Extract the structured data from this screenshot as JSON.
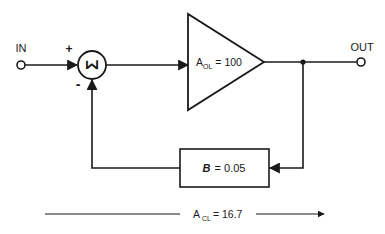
{
  "diagram": {
    "input_label": "IN",
    "output_label": "OUT",
    "summing_junction": {
      "symbol": "Σ",
      "plus_sign": "+",
      "minus_sign": "-"
    },
    "amplifier": {
      "gain_symbol": "A",
      "gain_subscript": "OL",
      "gain_value": "= 100"
    },
    "feedback_block": {
      "symbol": "B",
      "value": "= 0.05"
    },
    "closed_loop": {
      "gain_symbol": "A",
      "gain_subscript": "CL",
      "gain_value": "= 16.7"
    },
    "colors": {
      "stroke": "#1a1a1a",
      "background": "#ffffff"
    }
  }
}
